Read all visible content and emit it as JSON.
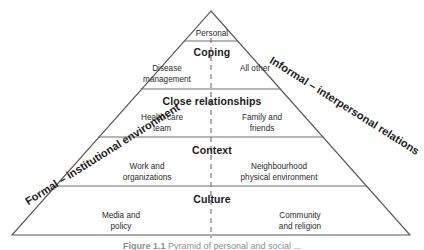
{
  "figure": {
    "type": "pyramid-diagram",
    "apex": {
      "label": "Personal"
    },
    "tiers": [
      {
        "title": "Coping",
        "left_cell": "Disease\nmanagement",
        "left_cell_line1": "Disease",
        "left_cell_line2": "management",
        "right_cell": "All other",
        "right_cell_line1": "All other",
        "right_cell_line2": ""
      },
      {
        "title": "Close relationships",
        "left_cell_line1": "Health care",
        "left_cell_line2": "team",
        "right_cell_line1": "Family and",
        "right_cell_line2": "friends"
      },
      {
        "title": "Context",
        "left_cell_line1": "Work and",
        "left_cell_line2": "organizations",
        "right_cell_line1": "Neighbourhood",
        "right_cell_line2": "physical environment"
      },
      {
        "title": "Culture",
        "left_cell_line1": "Media and",
        "left_cell_line2": "policy",
        "right_cell_line1": "Community",
        "right_cell_line2": "and religion"
      }
    ],
    "edge_labels": {
      "left": "Formal – institutional environment",
      "right": "Informal – interpersonal relations"
    },
    "caption": {
      "number": "Figure 1.1",
      "text": "Pyramid of personal and social ..."
    },
    "colors": {
      "outline": "#595959",
      "divider": "#6e6e6e",
      "center_dashed": "#6e6e6e",
      "text": "#1a1a1a",
      "subtext": "#2b2b2b",
      "background": "#ffffff",
      "caption": "#8f8f8f"
    }
  }
}
